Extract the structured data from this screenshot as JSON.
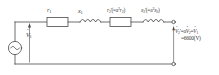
{
  "figure": {
    "type": "circuit-diagram",
    "stroke_color": "#4a4a4a",
    "text_color": "#3a3a3a",
    "background": "#ffffff"
  },
  "labels": {
    "r1": "r",
    "r1_sub": "1",
    "x1": "x",
    "x1_sub": "1",
    "r2_prime": "r",
    "r2_prime_sub": "2",
    "r2_prime_sup": "'",
    "r2_prime_paren": "(=a",
    "r2_prime_exp": "2",
    "r2_prime_tail": "r",
    "r2_prime_tail_sub": "2",
    "r2_prime_close": ")",
    "x2_prime": "x",
    "x2_prime_sub": "2",
    "x2_prime_sup": "'",
    "x2_prime_paren": "(=a",
    "x2_prime_exp": "2",
    "x2_prime_tail": "x",
    "x2_prime_tail_sub": "2",
    "x2_prime_close": ")",
    "source_voltage": "V",
    "source_voltage_sub": "1",
    "output_expr_v2p": "V",
    "output_expr_v2p_sub": "2",
    "output_expr_v2p_sup": "'",
    "output_expr_eq1": "=a",
    "output_expr_v2": "V",
    "output_expr_v2_sub": "2",
    "output_expr_eq2": "=",
    "output_expr_v1": "V",
    "output_expr_v1_sub": "1",
    "output_value": "=6600(V)"
  },
  "components": [
    {
      "name": "ac-source",
      "kind": "ac-voltage-source",
      "label": "V1"
    },
    {
      "name": "resistor-r1",
      "kind": "resistor",
      "label": "r1"
    },
    {
      "name": "inductor-x1",
      "kind": "inductor",
      "label": "x1"
    },
    {
      "name": "resistor-r2-prime",
      "kind": "resistor",
      "label": "r2'(=a^2 r2)"
    },
    {
      "name": "inductor-x2-prime",
      "kind": "inductor",
      "label": "x2'(=a^2 x2)"
    },
    {
      "name": "terminal-top",
      "kind": "open-terminal"
    },
    {
      "name": "terminal-bottom",
      "kind": "open-terminal"
    }
  ]
}
